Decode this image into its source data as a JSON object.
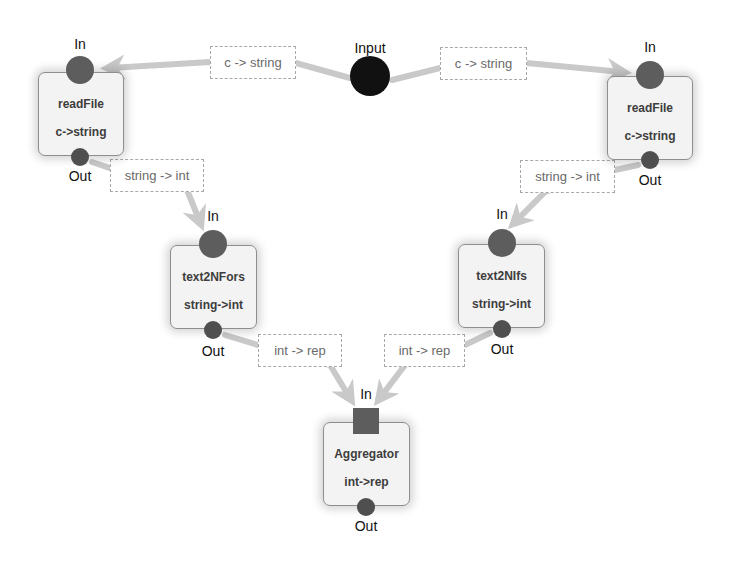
{
  "diagram": {
    "type": "dataflow-graph",
    "source": {
      "label": "Input",
      "color": "#111111"
    },
    "nodes": [
      {
        "id": "readFile-left",
        "title": "readFile",
        "signature": "c->string",
        "in_label": "In",
        "out_label": "Out"
      },
      {
        "id": "readFile-right",
        "title": "readFile",
        "signature": "c->string",
        "in_label": "In",
        "out_label": "Out"
      },
      {
        "id": "text2NFors",
        "title": "text2NFors",
        "signature": "string->int",
        "in_label": "In",
        "out_label": "Out"
      },
      {
        "id": "text2NIfs",
        "title": "text2NIfs",
        "signature": "string->int",
        "in_label": "In",
        "out_label": "Out"
      },
      {
        "id": "aggregator",
        "title": "Aggregator",
        "signature": "int->rep",
        "in_label": "In",
        "out_label": "Out"
      }
    ],
    "edges": [
      {
        "from": "Input",
        "to": "readFile-left",
        "label": "c -> string"
      },
      {
        "from": "Input",
        "to": "readFile-right",
        "label": "c -> string"
      },
      {
        "from": "readFile-left",
        "to": "text2NFors",
        "label": "string -> int"
      },
      {
        "from": "readFile-right",
        "to": "text2NIfs",
        "label": "string -> int"
      },
      {
        "from": "text2NFors",
        "to": "aggregator",
        "label": "int -> rep"
      },
      {
        "from": "text2NIfs",
        "to": "aggregator",
        "label": "int -> rep"
      }
    ],
    "colors": {
      "edge": "#c9c9c9",
      "port": "#5d5d5d",
      "node_fill": "#f3f3f3",
      "node_border": "#8e8e8e"
    }
  }
}
